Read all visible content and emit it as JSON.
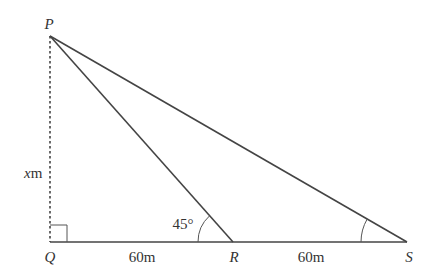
{
  "diagram": {
    "type": "geometry-triangle",
    "points": {
      "P": {
        "label": "P",
        "x": 50,
        "y": 36
      },
      "Q": {
        "label": "Q",
        "x": 50,
        "y": 242
      },
      "R": {
        "label": "R",
        "x": 233,
        "y": 242
      },
      "S": {
        "label": "S",
        "x": 407,
        "y": 242
      }
    },
    "segments": [
      {
        "from": "P",
        "to": "Q",
        "style": "dotted",
        "label": "x m"
      },
      {
        "from": "Q",
        "to": "R",
        "style": "solid",
        "label": "60m"
      },
      {
        "from": "R",
        "to": "S",
        "style": "solid",
        "label": "60m"
      },
      {
        "from": "P",
        "to": "R",
        "style": "solid"
      },
      {
        "from": "P",
        "to": "S",
        "style": "solid"
      }
    ],
    "angles": [
      {
        "at": "Q",
        "type": "right-angle"
      },
      {
        "at": "R",
        "between": [
          "P",
          "Q"
        ],
        "label": "45°"
      },
      {
        "at": "S",
        "between": [
          "P",
          "R"
        ],
        "label": ""
      }
    ],
    "labels": {
      "P": "P",
      "Q": "Q",
      "R": "R",
      "S": "S",
      "height_var": "x",
      "height_unit": "m",
      "qr_length": "60m",
      "rs_length": "60m",
      "angle_r": "45°"
    },
    "colors": {
      "line": "#444444",
      "text": "#333333"
    }
  }
}
